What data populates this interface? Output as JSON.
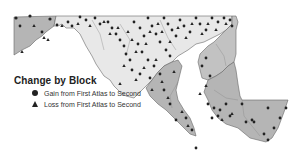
{
  "map": {
    "region": "Maryland",
    "colors": {
      "shaded_region": "#b5b5b5",
      "light_region": "#e8e8e8",
      "border": "#666666",
      "marker": "#222222",
      "background": "#ffffff"
    }
  },
  "legend": {
    "title": "Change by Block",
    "items": [
      {
        "symbol": "circle",
        "label": "Gain from First Atlas to Second"
      },
      {
        "symbol": "triangle",
        "label": "Loss from First Atlas to Second"
      }
    ]
  }
}
